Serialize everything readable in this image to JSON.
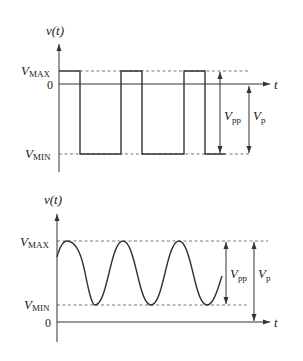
{
  "top_plot": {
    "waveform": "square",
    "y_axis_label": "v(t)",
    "x_axis_label": "t",
    "levels": {
      "max": "V",
      "max_sub": "MAX",
      "zero": "0",
      "min": "V",
      "min_sub": "MIN"
    },
    "annotations": {
      "vpp": {
        "main": "V",
        "sub": "pp"
      },
      "vp": {
        "main": "V",
        "sub": "p"
      }
    }
  },
  "bottom_plot": {
    "waveform": "sine",
    "y_axis_label": "v(t)",
    "x_axis_label": "t",
    "levels": {
      "max": "V",
      "max_sub": "MAX",
      "zero": "0",
      "min": "V",
      "min_sub": "MIN"
    },
    "annotations": {
      "vpp": {
        "main": "V",
        "sub": "pp"
      },
      "vp": {
        "main": "V",
        "sub": "p"
      }
    }
  },
  "colors": {
    "line": "#333333",
    "background": "#ffffff"
  }
}
